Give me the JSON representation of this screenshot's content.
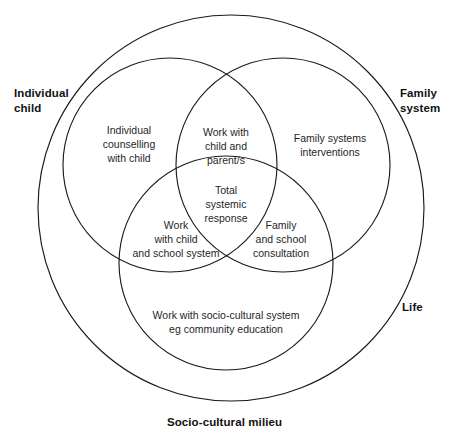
{
  "figure": {
    "type": "venn-diagram",
    "circle_count": 4,
    "stroke_color": "#1a1a1a",
    "background_color": "#ffffff"
  },
  "outer_labels": {
    "individual_child": "Individual\nchild",
    "family_system": "Family\nsystem",
    "life": "Life",
    "socio_cultural_milieu": "Socio-cultural milieu"
  },
  "regions": {
    "individual_counselling": "Individual\ncounselling\nwith child",
    "work_with_child_and_parents": "Work with\nchild and\nparent/s",
    "family_systems_interventions": "Family systems\ninterventions",
    "total_systemic_response": "Total\nsystemic\nresponse",
    "work_with_child_and_school_system": "Work\nwith child\nand school system",
    "family_and_school_consultation": "Family\nand school\nconsultation",
    "work_with_socio_cultural_system": "Work with socio-cultural system\neg community education"
  },
  "circles": {
    "life": {
      "cx": 231,
      "cy": 208,
      "r": 193
    },
    "individual_child": {
      "cx": 170,
      "cy": 165,
      "r": 107
    },
    "family_system": {
      "cx": 283,
      "cy": 165,
      "r": 107
    },
    "socio_cultural_milieu": {
      "cx": 226,
      "cy": 263,
      "r": 107
    }
  }
}
